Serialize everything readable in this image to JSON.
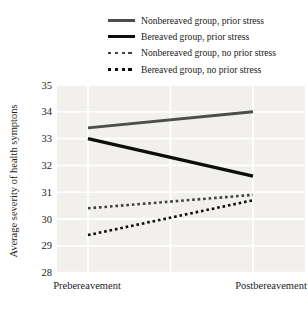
{
  "chart_data": {
    "type": "line",
    "title": "",
    "xlabel": "",
    "ylabel": "Average severity of health symptons",
    "categories": [
      "Prebereavement",
      "Postbereavement"
    ],
    "series": [
      {
        "name": "Nonbereaved group, prior stress",
        "style": "solid",
        "color": "#4d4d4d",
        "values": [
          33.4,
          34.0
        ]
      },
      {
        "name": "Bereaved group, prior stress",
        "style": "solid",
        "color": "#0d0d0d",
        "values": [
          33.0,
          31.6
        ]
      },
      {
        "name": "Nonbereaved group, no prior stress",
        "style": "dotted",
        "color": "#404040",
        "values": [
          30.4,
          30.9
        ]
      },
      {
        "name": "Bereaved group, no prior stress",
        "style": "dotted",
        "color": "#0d0d0d",
        "values": [
          29.4,
          30.7
        ]
      }
    ],
    "ylim": [
      28,
      35
    ],
    "yticks": [
      35,
      34,
      33,
      32,
      31,
      30,
      29,
      28
    ],
    "grid": true,
    "grid_color": "#ffffff",
    "plot_bg": "#f2f0ec",
    "legend_position": "top-right"
  }
}
